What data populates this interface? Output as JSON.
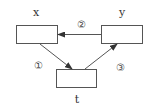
{
  "diagram": {
    "nodes": [
      {
        "id": "x",
        "label": "x"
      },
      {
        "id": "y",
        "label": "y"
      },
      {
        "id": "t",
        "label": "t"
      }
    ],
    "edges": [
      {
        "from": "x",
        "to": "t",
        "label": "①"
      },
      {
        "from": "y",
        "to": "x",
        "label": "②"
      },
      {
        "from": "t",
        "to": "y",
        "label": "③"
      }
    ],
    "colors": {
      "stroke": "#444444",
      "background": "#ffffff"
    }
  }
}
